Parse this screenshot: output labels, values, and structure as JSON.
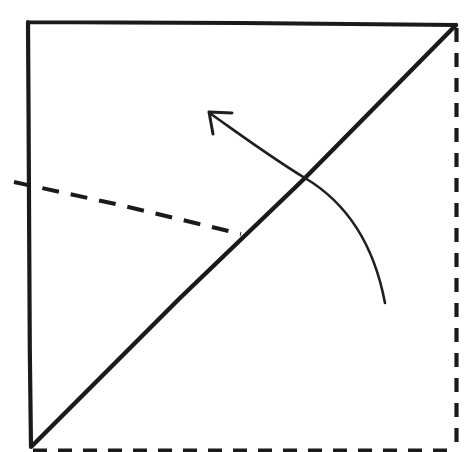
{
  "figure": {
    "background_color": "#ffffff",
    "ink_color": "#1a1a1a",
    "canvas": {
      "width": 466,
      "height": 452
    }
  },
  "shapes": {
    "paper_outline": {
      "name": "square-sheet",
      "corners": {
        "top_left": [
          28,
          22
        ],
        "top_right": [
          456,
          25
        ],
        "bottom_right": [
          456,
          450
        ],
        "bottom_left": [
          30,
          447
        ]
      },
      "solid_edges_path": "M 28 23 L 28 22 L 120 22.5 L 240 23 L 350 24 L 456 25 M 28 22 L 28.6 120 L 29.2 240 L 29.8 350 L 31 447",
      "solid_stroke_width": 4.2,
      "dashed_right_edge_path": "M 456.5 28 L 456.5 452",
      "dashed_bottom_edge_path": "M 33 450.5 L 456 450.5",
      "dashed_edge_stroke_width": 4.2,
      "dashed_edge_pattern": "14 11"
    },
    "diagonal_fold": {
      "name": "diagonal-valley-fold",
      "from": [
        32,
        446
      ],
      "to": [
        456,
        25
      ],
      "path": "M 32 446 L 180 298 L 305 178 L 456 25",
      "stroke_width": 4.4,
      "style": "solid"
    },
    "crease_line": {
      "name": "horizontal-crease-fold-line",
      "from": [
        14,
        183
      ],
      "to": [
        241,
        234
      ],
      "path": "M 14 182 L 120 205 L 241 234",
      "stroke_width": 4.0,
      "style": "dashed",
      "dash_pattern": "17 12"
    },
    "fold_arrow": {
      "name": "curved-fold-arrow",
      "tail": [
        385,
        303
      ],
      "tip": [
        209,
        112
      ],
      "crossing_point": [
        305,
        178
      ],
      "curve_path": "M 385 303 C 375 250 352 206 305 178 C 272 158 238 133 211 114",
      "head_path": "M 232 113 L 209 112 L 213 134",
      "stroke_width": 2.6,
      "head_stroke_width": 3.0,
      "direction": "up-left",
      "meaning": "fold up and to the left along the diagonal"
    }
  }
}
